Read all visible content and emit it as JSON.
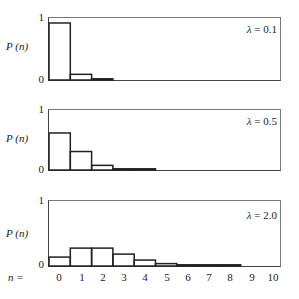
{
  "chart_data": [
    {
      "type": "bar",
      "title": "",
      "annotation": "λ = 0.1",
      "lambda": 0.1,
      "ylabel": "P (n)",
      "xlabel": "n =",
      "ylim": [
        0,
        1
      ],
      "yticks": [
        "0",
        "1"
      ],
      "categories": [
        "0",
        "1",
        "2",
        "3",
        "4",
        "5",
        "6",
        "7",
        "8",
        "9",
        "10"
      ],
      "values": [
        0.905,
        0.09,
        0.005,
        0,
        0,
        0,
        0,
        0,
        0,
        0,
        0
      ],
      "grid": false
    },
    {
      "type": "bar",
      "title": "",
      "annotation": "λ = 0.5",
      "lambda": 0.5,
      "ylabel": "P (n)",
      "xlabel": "n =",
      "ylim": [
        0,
        1
      ],
      "yticks": [
        "0",
        "1"
      ],
      "categories": [
        "0",
        "1",
        "2",
        "3",
        "4",
        "5",
        "6",
        "7",
        "8",
        "9",
        "10"
      ],
      "values": [
        0.607,
        0.303,
        0.076,
        0.013,
        0.002,
        0,
        0,
        0,
        0,
        0,
        0
      ],
      "grid": false
    },
    {
      "type": "bar",
      "title": "",
      "annotation": "λ = 2.0",
      "lambda": 2.0,
      "ylabel": "P (n)",
      "xlabel": "n =",
      "ylim": [
        0,
        1
      ],
      "yticks": [
        "0",
        "1"
      ],
      "categories": [
        "0",
        "1",
        "2",
        "3",
        "4",
        "5",
        "6",
        "7",
        "8",
        "9",
        "10"
      ],
      "values": [
        0.135,
        0.271,
        0.271,
        0.18,
        0.09,
        0.036,
        0.012,
        0.003,
        0.001,
        0,
        0
      ],
      "grid": false
    }
  ],
  "panels": [
    {
      "y_label": "P (n)",
      "tick_top": "1",
      "tick_bottom": "0",
      "lambda_symbol": "λ",
      "lambda_text": " = 0.1"
    },
    {
      "y_label": "P (n)",
      "tick_top": "1",
      "tick_bottom": "0",
      "lambda_symbol": "λ",
      "lambda_text": " = 0.5"
    },
    {
      "y_label": "P (n)",
      "tick_top": "1",
      "tick_bottom": "0",
      "lambda_symbol": "λ",
      "lambda_text": " = 2.0"
    }
  ],
  "x_axis": {
    "label": "n =",
    "ticks": [
      "0",
      "1",
      "2",
      "3",
      "4",
      "5",
      "6",
      "7",
      "8",
      "9",
      "10"
    ]
  }
}
